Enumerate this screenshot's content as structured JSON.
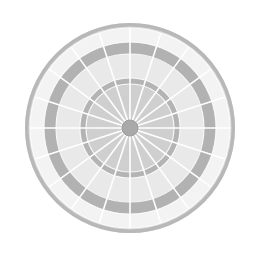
{
  "page": {
    "background_color": "#ffffff",
    "width": 258,
    "height": 255
  },
  "graphic": {
    "name": "dartboard-target",
    "description": "Grayscale concentric radial target with twenty wedge sectors",
    "center_x": 130,
    "center_y": 128,
    "outer_radius": 105,
    "sector_count": 20,
    "spoke_color": "#ffffff",
    "spoke_width": 1.6,
    "rim_stroke_color": "#b8b8b8",
    "rim_stroke_width": 3.5,
    "rings": [
      {
        "name": "outer-rim-ring",
        "inner_radius": 100,
        "outer_radius": 105,
        "color": "#d8d8d8",
        "label": "Outer rim"
      },
      {
        "name": "outer-light-band",
        "inner_radius": 86,
        "outer_radius": 100,
        "color": "#f3f3f3",
        "label": "Outer light band"
      },
      {
        "name": "outer-dark-ring",
        "inner_radius": 74,
        "outer_radius": 86,
        "color": "#b2b2b2",
        "label": "Outer dark ring"
      },
      {
        "name": "mid-light-band",
        "inner_radius": 50,
        "outer_radius": 74,
        "color": "#e9e9e9",
        "label": "Middle light band"
      },
      {
        "name": "inner-dark-ring",
        "inner_radius": 44,
        "outer_radius": 50,
        "color": "#b4b4b4",
        "label": "Inner dark ring"
      },
      {
        "name": "inner-disc",
        "inner_radius": 8,
        "outer_radius": 44,
        "color": "#cfcfcf",
        "label": "Inner disc"
      }
    ],
    "hub": {
      "name": "center-hub",
      "radius": 8,
      "color": "#a9a9a9",
      "stroke_color": "#9d9d9d",
      "label": "Bullseye"
    }
  },
  "colors": {
    "background": "#ffffff",
    "lightest": "#f3f3f3",
    "light": "#e9e9e9",
    "mid_light": "#d8d8d8",
    "mid": "#cfcfcf",
    "dark_band": "#b2b2b2",
    "hub": "#a9a9a9"
  }
}
